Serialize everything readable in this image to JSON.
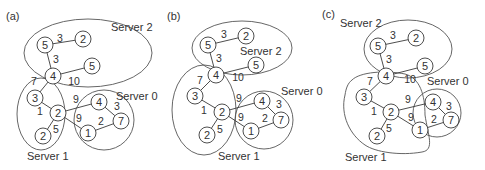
{
  "panels": [
    {
      "label": "(a)",
      "servers": {
        "server2": "Server 2",
        "server0": "Server 0",
        "server1": "Server 1"
      },
      "nodes": [
        "5",
        "2",
        "4",
        "5",
        "3",
        "2",
        "2",
        "4",
        "7",
        "1"
      ],
      "edges": [
        "3",
        "3",
        "10",
        "7",
        "1",
        "5",
        "9",
        "9",
        "3",
        "2"
      ]
    },
    {
      "label": "(b)",
      "servers": {
        "server2": "Server 2",
        "server0": "Server 0",
        "server1": "Server 1"
      },
      "nodes": [
        "5",
        "2",
        "4",
        "5",
        "3",
        "2",
        "2",
        "4",
        "7",
        "1"
      ],
      "edges": [
        "3",
        "3",
        "10",
        "7",
        "1",
        "5",
        "9",
        "9",
        "3",
        "2"
      ]
    },
    {
      "label": "(c)",
      "servers": {
        "server2": "Server 2",
        "server0": "Server 0",
        "server1": "Server 1"
      },
      "nodes": [
        "5",
        "2",
        "4",
        "5",
        "3",
        "2",
        "2",
        "4",
        "7",
        "1"
      ],
      "edges": [
        "3",
        "3",
        "10",
        "7",
        "1",
        "5",
        "9",
        "9",
        "3",
        "2"
      ]
    }
  ]
}
